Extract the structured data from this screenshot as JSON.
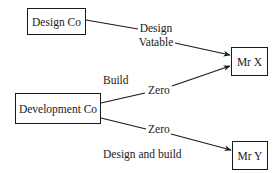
{
  "diagram": {
    "nodes": [
      {
        "id": "design-co",
        "label": "Design Co"
      },
      {
        "id": "development-co",
        "label": "Development Co"
      },
      {
        "id": "mr-x",
        "label": "Mr X"
      },
      {
        "id": "mr-y",
        "label": "Mr Y"
      }
    ],
    "edges": [
      {
        "from": "design-co",
        "to": "mr-x",
        "label_line1": "Design",
        "label_line2": "Vatable"
      },
      {
        "from": "development-co",
        "to": "mr-x",
        "label": "Zero",
        "side_label": "Build"
      },
      {
        "from": "development-co",
        "to": "mr-y",
        "label": "Zero",
        "side_label": "Design and build"
      }
    ]
  },
  "colors": {
    "ink": "#1a1a1a",
    "background": "#ffffff"
  }
}
